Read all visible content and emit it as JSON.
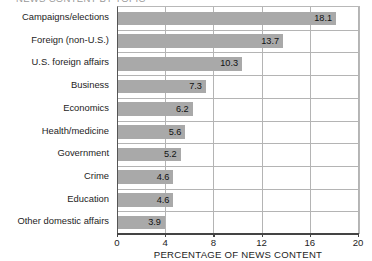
{
  "chart_data": {
    "type": "bar",
    "orientation": "horizontal",
    "title": "NEWS CONTENT BY TOPIC",
    "xlabel": "PERCENTAGE OF NEWS CONTENT",
    "ylabel": "",
    "xlim": [
      0,
      20
    ],
    "xticks": [
      "0",
      "4",
      "8",
      "12",
      "16",
      "20"
    ],
    "grid": "vertical",
    "legend": "none",
    "bar_color": "#a9a9a9",
    "categories": [
      "Campaigns/elections",
      "Foreign (non-U.S.)",
      "U.S. foreign affairs",
      "Business",
      "Economics",
      "Health/medicine",
      "Government",
      "Crime",
      "Education",
      "Other domestic affairs"
    ],
    "values": [
      18.1,
      13.7,
      10.3,
      7.3,
      6.2,
      5.6,
      5.2,
      4.6,
      4.6,
      3.9
    ],
    "value_labels": [
      "18.1",
      "13.7",
      "10.3",
      "7.3",
      "6.2",
      "5.6",
      "5.2",
      "4.6",
      "4.6",
      "3.9"
    ]
  }
}
